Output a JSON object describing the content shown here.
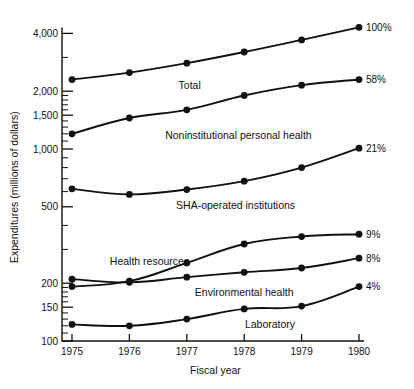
{
  "chart_data": {
    "type": "line",
    "title": "",
    "xlabel": "Fiscal year",
    "ylabel": "Expenditures (millions of dollars)",
    "yscale": "log",
    "ylim": [
      100,
      4400
    ],
    "grid": false,
    "legend": "inline-labels",
    "categories": [
      "1975",
      "1976",
      "1977",
      "1978",
      "1979",
      "1980"
    ],
    "x": [
      1975,
      1976,
      1977,
      1978,
      1979,
      1980
    ],
    "y_tick_labels": [
      "100",
      "150",
      "200",
      "500",
      "1,000",
      "1,500",
      "2,000",
      "4,000"
    ],
    "y_tick_values": [
      100,
      150,
      200,
      500,
      1000,
      1500,
      2000,
      4000
    ],
    "y_minor_ticks": [
      110,
      120,
      130,
      140,
      160,
      170,
      180,
      190,
      300,
      400,
      600,
      700,
      800,
      900,
      1100,
      1200,
      1300,
      1400,
      1600,
      1700,
      1800,
      1900,
      3000
    ],
    "series": [
      {
        "name": "Total",
        "label": "Total",
        "end_label": "100%",
        "values": [
          2300,
          2500,
          2800,
          3200,
          3700,
          4300
        ]
      },
      {
        "name": "Noninstitutional personal health",
        "label": "Noninstitutional personal health",
        "end_label": "58%",
        "values": [
          1200,
          1450,
          1600,
          1900,
          2150,
          2300
        ]
      },
      {
        "name": "SHA-operated institutions",
        "label": "SHA-operated institutions",
        "end_label": "21%",
        "values": [
          620,
          580,
          615,
          680,
          800,
          1010
        ]
      },
      {
        "name": "Health resources",
        "label": "Health resources",
        "end_label": "9%",
        "values": [
          192,
          205,
          255,
          320,
          350,
          360
        ]
      },
      {
        "name": "Environmental health",
        "label": "Environmental health",
        "end_label": "8%",
        "values": [
          210,
          202,
          215,
          228,
          240,
          270
        ]
      },
      {
        "name": "Laboratory",
        "label": "Laboratory",
        "end_label": "4%",
        "values": [
          122,
          120,
          130,
          147,
          152,
          192
        ]
      }
    ],
    "series_label_positions": [
      {
        "x": 1977.05,
        "y": 2150
      },
      {
        "x": 1977.9,
        "y": 1180
      },
      {
        "x": 1977.85,
        "y": 510
      },
      {
        "x": 1976.35,
        "y": 262
      },
      {
        "x": 1978.0,
        "y": 180
      },
      {
        "x": 1978.45,
        "y": 122
      }
    ]
  }
}
